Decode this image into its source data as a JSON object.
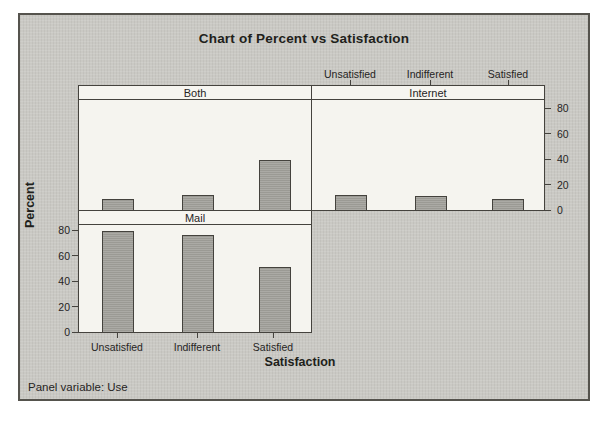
{
  "title": "Chart of Percent vs Satisfaction",
  "footnote": "Panel variable: Use",
  "chart_data": {
    "type": "bar",
    "title": "Chart of Percent vs Satisfaction",
    "xlabel": "Satisfaction",
    "ylabel": "Percent",
    "panel_variable_label": "Panel variable: Use",
    "categories": [
      "Unsatisfied",
      "Indifferent",
      "Satisfied"
    ],
    "panels": [
      {
        "name": "Both",
        "position": "top-left",
        "values": [
          9,
          12,
          39
        ]
      },
      {
        "name": "Internet",
        "position": "top-right",
        "values": [
          12,
          11,
          9
        ]
      },
      {
        "name": "Mail",
        "position": "bottom-left",
        "values": [
          79,
          76,
          51
        ]
      }
    ],
    "ylim": [
      0,
      80
    ],
    "yticks": [
      0,
      20,
      40,
      60,
      80
    ],
    "legend": "none",
    "grid": "off",
    "layout": "2x2 panel grid; bottom-right panel empty; top-row y-axis on right, bottom-row y-axis on left; category labels on top of top-right panel and below bottom-left panel",
    "colors": {
      "figure_bg": "#cac9c4",
      "panel_bg": "#f5f4ef",
      "bar_fill": "#a3a29c",
      "bar_border": "#44423d",
      "line": "#45433e",
      "text": "#211f1b"
    }
  }
}
